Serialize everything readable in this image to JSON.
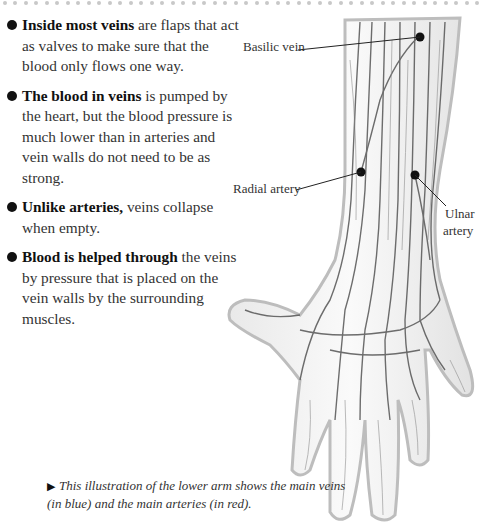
{
  "bullets": [
    {
      "bold": "Inside most veins",
      "text": " are flaps that act as valves to make sure that the blood only flows one way."
    },
    {
      "bold": "The blood in veins",
      "text": " is pumped by the heart, but the blood pressure is much lower than in arteries and vein walls do not need to be as strong."
    },
    {
      "bold": "Unlike arteries,",
      "text": " veins collapse when empty."
    },
    {
      "bold": "Blood is helped through",
      "text": " the veins by pressure that is placed on the vein walls by the surrounding muscles."
    }
  ],
  "labels": {
    "basilic_vein": "Basilic vein",
    "radial_artery": "Radial artery",
    "ulnar_artery_line1": "Ulnar",
    "ulnar_artery_line2": "artery"
  },
  "caption": {
    "marker": "▶",
    "text": "This illustration of the lower arm shows the main veins (in blue) and the main arteries (in red)."
  },
  "colors": {
    "text": "#333333",
    "dots": "#c8c8c8",
    "ink": "#111111"
  }
}
